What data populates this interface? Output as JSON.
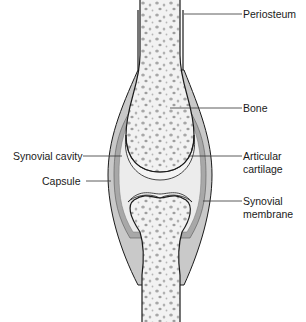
{
  "diagram": {
    "colors": {
      "background": "#ffffff",
      "capsule": "#c9c9c9",
      "synovial_membrane": "#a8a8a8",
      "cavity": "#ececec",
      "cartilage": "#f4f4f4",
      "bone": "#f2f2f2",
      "bone_dots": "#9a9a9a",
      "outline": "#1a1a1a",
      "leader": "#333333"
    },
    "labels": {
      "periosteum": "Periosteum",
      "bone": "Bone",
      "articular_line1": "Articular",
      "articular_line2": "cartilage",
      "synovial_cavity": "Synovial cavity",
      "capsule": "Capsule",
      "synovial_membrane_line1": "Synovial",
      "synovial_membrane_line2": "membrane"
    }
  }
}
